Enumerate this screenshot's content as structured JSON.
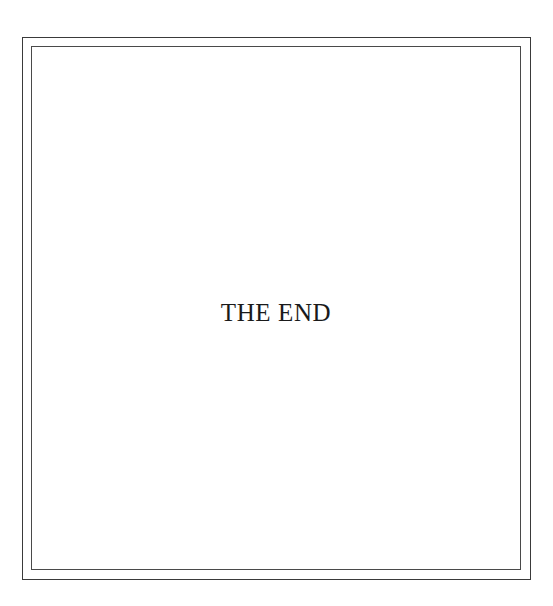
{
  "page": {
    "background_color": "#ffffff",
    "width": 553,
    "height": 606
  },
  "frame": {
    "style": "double-rule-border",
    "outer_color": "#3a3a3a",
    "inner_color": "#4a4a4a"
  },
  "content": {
    "end_legend": "THE END",
    "text_color": "#1a1a1a"
  }
}
